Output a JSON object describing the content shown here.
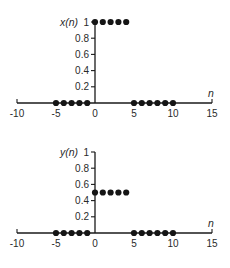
{
  "chart_data": [
    {
      "type": "scatter",
      "title": "",
      "ylabel": "x(n)",
      "xlabel": "n",
      "xlim": [
        -10,
        15
      ],
      "ylim": [
        0,
        1
      ],
      "xticks": [
        -10,
        -5,
        0,
        5,
        10,
        15
      ],
      "yticks": [
        0.2,
        0.4,
        0.6,
        0.8,
        1
      ],
      "ytick_labels": [
        "0.2",
        "0.4",
        "0.6",
        "0.8",
        "1"
      ],
      "grid": false,
      "series": [
        {
          "name": "x(n)",
          "x": [
            -5,
            -4,
            -3,
            -2,
            -1,
            0,
            1,
            2,
            3,
            4,
            5,
            6,
            7,
            8,
            9,
            10
          ],
          "values": [
            0,
            0,
            0,
            0,
            0,
            1,
            1,
            1,
            1,
            1,
            0,
            0,
            0,
            0,
            0,
            0
          ]
        }
      ]
    },
    {
      "type": "scatter",
      "title": "",
      "ylabel": "y(n)",
      "xlabel": "n",
      "xlim": [
        -10,
        15
      ],
      "ylim": [
        0,
        1
      ],
      "xticks": [
        -10,
        -5,
        0,
        5,
        10,
        15
      ],
      "yticks": [
        0.2,
        0.4,
        0.6,
        0.8,
        1
      ],
      "ytick_labels": [
        "0.2",
        "0.4",
        "0.6",
        "0.8",
        "1"
      ],
      "grid": false,
      "series": [
        {
          "name": "y(n)",
          "x": [
            -5,
            -4,
            -3,
            -2,
            -1,
            0,
            1,
            2,
            3,
            4,
            5,
            6,
            7,
            8,
            9,
            10
          ],
          "values": [
            0,
            0,
            0,
            0,
            0,
            0.5,
            0.5,
            0.5,
            0.5,
            0.5,
            0,
            0,
            0,
            0,
            0,
            0
          ]
        }
      ]
    }
  ],
  "colors": {
    "ink": "#151515",
    "background": "#ffffff"
  }
}
